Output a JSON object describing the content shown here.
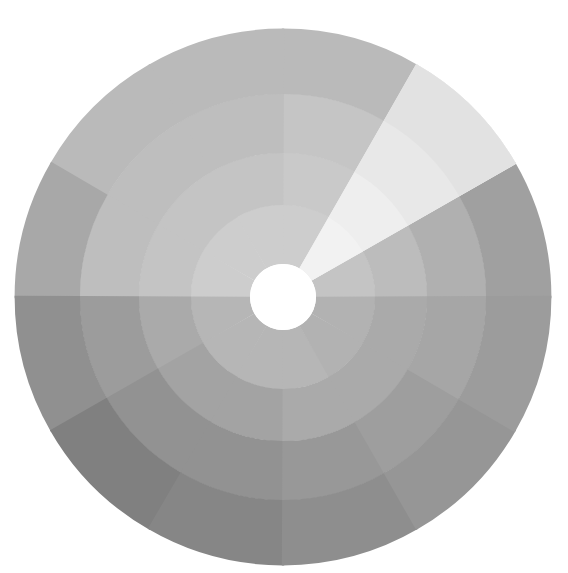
{
  "chart_data": {
    "type": "pie",
    "subtype": "sunburst-polar-grayscale",
    "title": "",
    "subtitle": "",
    "xlabel": "",
    "ylabel": "",
    "grid": false,
    "legend": "none",
    "background_color": "#ffffff",
    "center": {
      "cx": 283,
      "cy": 297
    },
    "hole_radius": 33,
    "outer_radius": 268,
    "sector_count": 12,
    "sector_angle_degrees": 30,
    "angle_offset_degrees": 0,
    "ring_count": 4,
    "ring_radii": [
      33,
      92,
      144,
      203,
      268
    ],
    "ring_labels": [
      "ring-1-inner",
      "ring-2",
      "ring-3",
      "ring-4-outer"
    ],
    "categories": [
      "S1 0-30",
      "S2 30-60",
      "S3 60-90",
      "S4 90-120",
      "S5 120-150",
      "S6 150-180",
      "S7 180-210",
      "S8 210-240",
      "S9 240-270",
      "S10 270-300",
      "S11 300-330",
      "S12 330-360"
    ],
    "series": [
      {
        "name": "ring-1-inner",
        "values": [
          196,
          242,
          205,
          205,
          205,
          205,
          182,
          182,
          182,
          182,
          178,
          178
        ],
        "colors": [
          "#c4c4c4",
          "#f2f2f2",
          "#cdcdcd",
          "#cdcdcd",
          "#cdcdcd",
          "#cdcdcd",
          "#b6b6b6",
          "#b6b6b6",
          "#b6b6b6",
          "#b6b6b6",
          "#b2b2b2",
          "#b2b2b2"
        ]
      },
      {
        "name": "ring-2",
        "values": [
          188,
          238,
          201,
          196,
          196,
          196,
          170,
          163,
          163,
          170,
          170,
          170
        ],
        "colors": [
          "#bcbcbc",
          "#eeeeee",
          "#c9c9c9",
          "#c4c4c4",
          "#c4c4c4",
          "#c4c4c4",
          "#aaaaaa",
          "#a3a3a3",
          "#a3a3a3",
          "#aaaaaa",
          "#aaaaaa",
          "#aaaaaa"
        ]
      },
      {
        "name": "ring-3",
        "values": [
          176,
          232,
          197,
          190,
          190,
          190,
          156,
          146,
          146,
          152,
          158,
          166
        ],
        "colors": [
          "#b0b0b0",
          "#e8e8e8",
          "#c5c5c5",
          "#bebebe",
          "#bebebe",
          "#bebebe",
          "#9c9c9c",
          "#929292",
          "#929292",
          "#989898",
          "#9e9e9e",
          "#a6a6a6"
        ]
      },
      {
        "name": "ring-4-outer",
        "values": [
          160,
          226,
          186,
          186,
          186,
          168,
          144,
          128,
          134,
          142,
          150,
          156
        ],
        "colors": [
          "#a0a0a0",
          "#e2e2e2",
          "#bababa",
          "#bababa",
          "#bababa",
          "#a8a8a8",
          "#909090",
          "#808080",
          "#868686",
          "#8e8e8e",
          "#969696",
          "#9c9c9c"
        ]
      }
    ],
    "highlight": {
      "name": "bright-wedge",
      "start_angle_degrees": 30,
      "end_angle_degrees": 60,
      "color": "#eeeeee",
      "note": "near-white wedge in upper-right quadrant spanning all rings"
    },
    "value_range": [
      128,
      242
    ],
    "value_unit": "grayscale-level"
  },
  "figure": {
    "width": 568,
    "height": 573,
    "name": "grayscale-sunburst-chart"
  }
}
